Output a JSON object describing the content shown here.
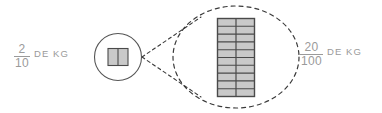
{
  "canvas": {
    "width": 382,
    "height": 113,
    "background": "#ffffff"
  },
  "colors": {
    "text": "#9a9a9a",
    "outline": "#555555",
    "cell_fill": "#c9c9c9",
    "cell_stroke": "#4a4a4a",
    "dashed": "#3a3a3a"
  },
  "left": {
    "fraction": {
      "numerator": "2",
      "denominator": "10"
    },
    "unit": "DE KG",
    "shape": {
      "kind": "circle-with-bar",
      "columns": 2,
      "rows": 1,
      "total_cells": 2,
      "shaded_cells": 2
    }
  },
  "right": {
    "fraction": {
      "numerator": "20",
      "denominator": "100"
    },
    "unit": "DE KG"
  },
  "magnifier": {
    "kind": "dashed-ellipse-callout",
    "grid": {
      "columns": 2,
      "rows": 10,
      "total_cells": 20,
      "shaded_cells": 20
    }
  }
}
